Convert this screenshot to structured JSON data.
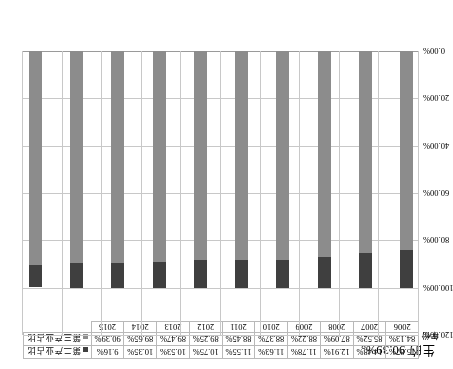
{
  "caption": {
    "text": "生的 90.39%。"
  },
  "axis": {
    "year_row_label": "年份",
    "y_ticks": [
      "0.00%",
      "20.00%",
      "40.00%",
      "60.00%",
      "80.00%",
      "100.00%",
      "120.00%"
    ],
    "y_min": 0,
    "y_max": 120
  },
  "legend": {
    "items": [
      {
        "label": "第二产业占比",
        "color": "#3f3f3f",
        "icon": "square-swatch-icon"
      },
      {
        "label": "第三产业占比",
        "color": "#8c8c8c",
        "icon": "square-swatch-icon"
      }
    ]
  },
  "chart_data": {
    "type": "bar",
    "stacked": true,
    "title": "",
    "xlabel": "年份",
    "ylabel": "",
    "ylim": [
      0,
      120
    ],
    "grid": true,
    "legend_position": "table-right",
    "categories": [
      "2006",
      "2007",
      "2008",
      "2009",
      "2010",
      "2011",
      "2012",
      "2013",
      "2014",
      "2015"
    ],
    "series": [
      {
        "name": "第二产业占比",
        "color": "#3f3f3f",
        "values": [
          15.87,
          14.48,
          12.91,
          11.78,
          11.63,
          11.55,
          10.75,
          10.53,
          10.35,
          9.16
        ],
        "labels": [
          "15.87%",
          "14.48%",
          "12.91%",
          "11.78%",
          "11.63%",
          "11.55%",
          "10.75%",
          "10.53%",
          "10.35%",
          "9.16%"
        ]
      },
      {
        "name": "第三产业占比",
        "color": "#8c8c8c",
        "values": [
          84.13,
          85.52,
          87.09,
          88.22,
          88.37,
          88.45,
          89.25,
          89.47,
          89.65,
          90.39
        ],
        "labels": [
          "84.13%",
          "85.52%",
          "87.09%",
          "88.22%",
          "88.37%",
          "88.45%",
          "89.25%",
          "89.47%",
          "89.65%",
          "90.39%"
        ]
      }
    ]
  }
}
